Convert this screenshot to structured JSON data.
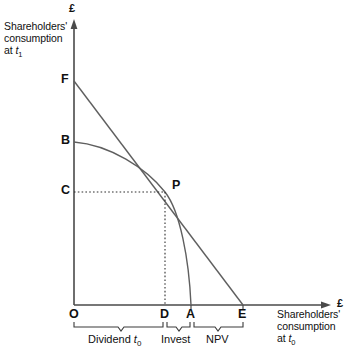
{
  "figure": {
    "axes": {
      "y": {
        "caption": "Shareholders'\nconsumption\nat ",
        "caption_time": "t",
        "caption_time_sub": "1",
        "currency_symbol": "£"
      },
      "x": {
        "caption": "Shareholders'\nconsumption\nat ",
        "caption_time": "t",
        "caption_time_sub": "0",
        "currency_symbol": "£"
      }
    },
    "points": {
      "origin": {
        "label": "O",
        "x": 74,
        "y": 305
      },
      "F": {
        "label": "F",
        "x": 74,
        "y": 81
      },
      "B": {
        "label": "B",
        "x": 74,
        "y": 142
      },
      "C": {
        "label": "C",
        "x": 74,
        "y": 192
      },
      "P": {
        "label": "P",
        "x": 165,
        "y": 192
      },
      "D": {
        "label": "D",
        "x": 165,
        "y": 305
      },
      "A": {
        "label": "A",
        "x": 191,
        "y": 305
      },
      "E": {
        "label": "E",
        "x": 243,
        "y": 305
      }
    },
    "brackets": [
      {
        "id": "dividend",
        "label": "Dividend ",
        "label_var": "t",
        "label_sub": "0",
        "from": "O",
        "to": "D"
      },
      {
        "id": "invest",
        "label": "Invest",
        "label_var": "",
        "label_sub": "",
        "from": "D",
        "to": "A"
      },
      {
        "id": "npv",
        "label": "NPV",
        "label_var": "",
        "label_sub": "",
        "from": "A",
        "to": "E"
      }
    ],
    "curves": [
      {
        "id": "market-line",
        "name": "capital-market-line-FE",
        "from": "F",
        "to": "E",
        "type": "straight"
      },
      {
        "id": "production-curve",
        "name": "production-possibility-curve-BA",
        "from": "B",
        "to": "A",
        "type": "concave"
      }
    ],
    "guides": [
      {
        "id": "guide-horizontal",
        "name": "dotted-guide-C-to-P",
        "style": "dotted"
      },
      {
        "id": "guide-vertical",
        "name": "dotted-guide-P-to-D",
        "style": "dotted"
      }
    ],
    "colors": {
      "axis": "#4a4a4a",
      "curve": "#5a5a5a",
      "guide": "#3a3a3a",
      "text": "#101010",
      "background": "#ffffff"
    }
  }
}
